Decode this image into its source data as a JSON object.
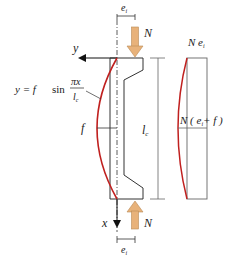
{
  "figure": {
    "type": "structural-mechanics-diagram"
  },
  "labels": {
    "force_top": "N",
    "force_bottom": "N",
    "eccentricity_top": "e",
    "eccentricity_top_sub": "i",
    "eccentricity_bottom": "e",
    "eccentricity_bottom_sub": "i",
    "axis_y": "y",
    "axis_x": "x",
    "deflection": "f",
    "length": "l",
    "length_sub": "c",
    "equation_lhs": "y = f",
    "equation_sin": "sin",
    "equation_num": "πx",
    "equation_den": "l",
    "equation_den_sub": "c",
    "moment_top": "N e",
    "moment_top_sub": "i",
    "moment_mid_prefix": "N ( e",
    "moment_mid_sub": "i",
    "moment_mid_suffix": "+ f )"
  },
  "colors": {
    "line": "#333333",
    "deflection_curve": "#c0201f",
    "force_arrow_fill": "#e8b27a",
    "force_arrow_stroke": "#b98a55",
    "dimension_line": "#666666"
  }
}
